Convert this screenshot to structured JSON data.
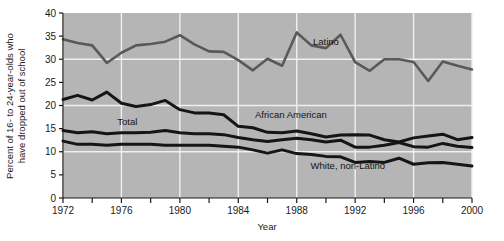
{
  "chart_data": {
    "type": "line",
    "title": "",
    "xlabel": "Year",
    "ylabel": "Percent of 16- to 24-year-olds who have dropped out of school",
    "ylabel_line1": "Percent of 16- to 24-year-olds who",
    "ylabel_line2": "have dropped out of school",
    "xlim": [
      1972,
      2000
    ],
    "ylim": [
      0,
      40
    ],
    "ytick_values": [
      0,
      5,
      10,
      15,
      20,
      25,
      30,
      35,
      40
    ],
    "ytick_labels": [
      "0",
      "5",
      "10",
      "15",
      "20",
      "25",
      "30",
      "35",
      "40"
    ],
    "xtick_values": [
      1972,
      1974,
      1976,
      1978,
      1980,
      1982,
      1984,
      1986,
      1988,
      1990,
      1992,
      1994,
      1996,
      1998,
      2000
    ],
    "xtick_labels": [
      "1972",
      "",
      "1976",
      "",
      "1980",
      "",
      "1984",
      "",
      "1988",
      "",
      "1992",
      "",
      "1996",
      "",
      "2000"
    ],
    "xtick_labeled": [
      "1972",
      "1976",
      "1980",
      "1984",
      "1988",
      "1992",
      "1996",
      "2000"
    ],
    "grid": "white gridlines, vertical every 4 years, horizontal every 10 percent",
    "plot_background": "#b5b5b5",
    "gridline_color": "#f0f0f0",
    "legend_position": "inline labels on plot",
    "x": [
      1972,
      1973,
      1974,
      1975,
      1976,
      1977,
      1978,
      1979,
      1980,
      1981,
      1982,
      1983,
      1984,
      1985,
      1986,
      1987,
      1988,
      1989,
      1990,
      1991,
      1992,
      1993,
      1994,
      1995,
      1996,
      1997,
      1998,
      1999,
      2000
    ],
    "series": [
      {
        "name": "Latino",
        "color": "#595959",
        "width": 2.6,
        "label_x": 1990.0,
        "label_y": 33.0,
        "values": [
          34.3,
          33.5,
          33.0,
          29.2,
          31.4,
          33.0,
          33.3,
          33.8,
          35.2,
          33.2,
          31.7,
          31.6,
          29.8,
          27.6,
          30.1,
          28.6,
          35.8,
          33.0,
          32.4,
          35.3,
          29.4,
          27.5,
          30.0,
          30.0,
          29.4,
          25.3,
          29.5,
          28.6,
          27.8
        ]
      },
      {
        "name": "African American",
        "color": "#151515",
        "width": 3.0,
        "label_x": 1987.6,
        "label_y": 17.2,
        "values": [
          21.3,
          22.2,
          21.2,
          22.9,
          20.5,
          19.8,
          20.2,
          21.1,
          19.1,
          18.4,
          18.4,
          18.0,
          15.5,
          15.2,
          14.2,
          14.1,
          14.5,
          13.9,
          13.2,
          13.6,
          13.7,
          13.6,
          12.6,
          12.1,
          13.0,
          13.4,
          13.8,
          12.6,
          13.1
        ]
      },
      {
        "name": "Total",
        "color": "#151515",
        "width": 3.0,
        "label_x": 1976.4,
        "label_y": 15.8,
        "values": [
          14.6,
          14.1,
          14.3,
          13.9,
          14.1,
          14.1,
          14.2,
          14.6,
          14.1,
          13.9,
          13.9,
          13.7,
          13.1,
          12.6,
          12.2,
          12.6,
          12.9,
          12.6,
          12.1,
          12.5,
          11.0,
          11.0,
          11.4,
          12.0,
          11.1,
          11.0,
          11.8,
          11.2,
          10.9
        ]
      },
      {
        "name": "White, non-Latino",
        "color": "#151515",
        "width": 3.0,
        "label_x": 1991.5,
        "label_y": 6.2,
        "values": [
          12.3,
          11.6,
          11.6,
          11.4,
          11.6,
          11.6,
          11.6,
          11.4,
          11.4,
          11.4,
          11.4,
          11.2,
          11.0,
          10.4,
          9.7,
          10.4,
          9.6,
          9.4,
          9.0,
          8.9,
          7.7,
          7.9,
          7.7,
          8.6,
          7.3,
          7.6,
          7.7,
          7.3,
          6.9
        ]
      }
    ]
  },
  "labels": {
    "latino": "Latino",
    "african_american": "African American",
    "total": "Total",
    "white_non_latino": "White, non-Latino",
    "x_axis": "Year",
    "y_axis_line1": "Percent of 16- to 24-year-olds who",
    "y_axis_line2": "have dropped out of school"
  }
}
